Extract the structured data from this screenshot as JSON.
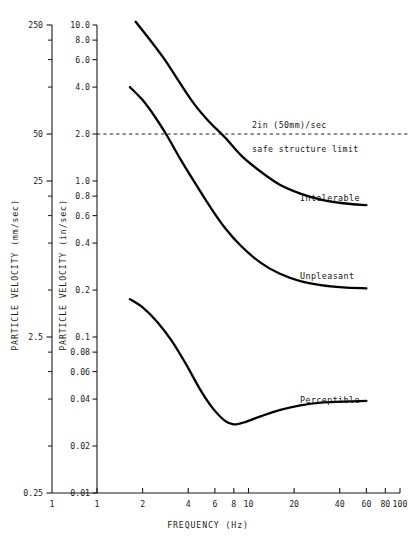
{
  "chart_data": {
    "type": "line",
    "title": "",
    "xlabel": "FREQUENCY (Hz)",
    "ylabel": "PARTICLE VELOCITY (in/sec)",
    "ylabel_secondary": "PARTICLE VELOCITY (mm/sec)",
    "xscale": "log",
    "yscale": "log",
    "xlim": [
      1,
      100
    ],
    "ylim": [
      0.01,
      10
    ],
    "ylim_secondary": [
      0.25,
      250
    ],
    "grid": false,
    "legend": "inline-labels",
    "xticks": [
      1,
      2,
      4,
      6,
      8,
      10,
      20,
      40,
      60,
      80,
      100
    ],
    "xticklabels": [
      "1",
      "2",
      "4",
      "6",
      "8",
      "10",
      "20",
      "40",
      "60",
      "80",
      "100"
    ],
    "yticks": [
      10.0,
      8.0,
      6.0,
      4.0,
      2.0,
      1.0,
      0.8,
      0.6,
      0.4,
      0.2,
      0.1,
      0.08,
      0.06,
      0.04,
      0.02,
      0.01
    ],
    "yticklabels": [
      "10.0",
      "8.0",
      "6.0",
      "4.0",
      "2.0",
      "1.0",
      "0.8",
      "0.6",
      "0.4",
      "0.2",
      "0.1",
      "0.08",
      "0.06",
      "0.04",
      "0.02",
      "0.01"
    ],
    "yticks_secondary": [
      250,
      200,
      150,
      100,
      50,
      25,
      20,
      15,
      10,
      5,
      2.5,
      2.0,
      1.5,
      1.0,
      0.5,
      0.25
    ],
    "yticklabels_secondary": [
      "250",
      "",
      "",
      "",
      "50",
      "25",
      "",
      "",
      "",
      "",
      "2.5",
      "",
      "",
      "",
      "",
      "0.25"
    ],
    "reference_lines": [
      {
        "name": "safe-structure-limit",
        "orientation": "horizontal",
        "value": 2.0,
        "unit": "in/sec",
        "style": "dashed",
        "label_top": "2in (50mm)/sec",
        "label_bottom": "safe structure limit"
      }
    ],
    "series": [
      {
        "name": "Intolerable",
        "label": "Intolerable",
        "x": [
          1.8,
          2.2,
          2.8,
          3.5,
          4.4,
          5.5,
          7.0,
          9.0,
          12.0,
          16.0,
          22.0,
          30.0,
          42.0,
          60.0
        ],
        "y": [
          10.5,
          8.2,
          6.0,
          4.3,
          3.1,
          2.4,
          1.9,
          1.45,
          1.15,
          0.95,
          0.83,
          0.76,
          0.72,
          0.7
        ]
      },
      {
        "name": "Unpleasant",
        "label": "Unpleasant",
        "x": [
          1.65,
          2.0,
          2.4,
          2.9,
          3.6,
          4.5,
          5.6,
          7.0,
          9.0,
          12.0,
          16.0,
          22.0,
          30.0,
          42.0,
          60.0
        ],
        "y": [
          4.0,
          3.3,
          2.6,
          1.95,
          1.35,
          0.95,
          0.68,
          0.5,
          0.38,
          0.3,
          0.255,
          0.228,
          0.215,
          0.208,
          0.205
        ]
      },
      {
        "name": "Perceptible",
        "label": "Perceptible",
        "x": [
          1.65,
          2.0,
          2.5,
          3.1,
          3.9,
          4.8,
          5.8,
          7.0,
          8.0,
          9.5,
          12.0,
          16.0,
          22.0,
          30.0,
          42.0,
          60.0
        ],
        "y": [
          0.175,
          0.155,
          0.125,
          0.095,
          0.066,
          0.046,
          0.035,
          0.029,
          0.0275,
          0.0285,
          0.031,
          0.034,
          0.0365,
          0.038,
          0.0385,
          0.039
        ]
      }
    ]
  },
  "axes": {
    "x_title": "FREQUENCY (Hz)",
    "y_inner_title": "PARTICLE VELOCITY (in/sec)",
    "y_outer_title": "PARTICLE VELOCITY (mm/sec)"
  },
  "annotations": {
    "limit_top": "2in (50mm)/sec",
    "limit_bottom": "safe structure limit",
    "curve_intolerable": "Intolerable",
    "curve_unpleasant": "Unpleasant",
    "curve_perceptible": "Perceptible"
  },
  "colors": {
    "ink": "#000000",
    "axis": "#1a1a1a",
    "background": "#ffffff"
  }
}
